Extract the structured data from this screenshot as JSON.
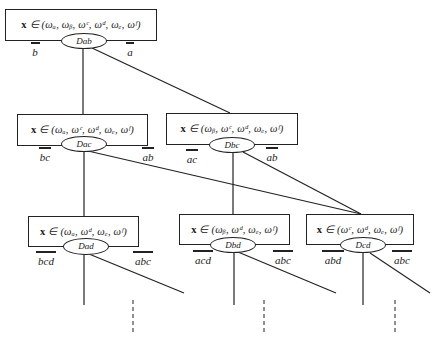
{
  "diagram": {
    "nodes": [
      {
        "id": "ab",
        "set": "x ∈ (ω a, ω b, ω c, ω d, ω e, ω f)",
        "set_prefix": "x",
        "set_rest": " ∈ (ωₐ, ωᵦ, ωᶜ, ωᵈ, ωₑ, ωᶠ)",
        "decision": "Dab",
        "left_label": "b",
        "right_label": "a"
      },
      {
        "id": "ac",
        "set": "x ∈ (ω a, ω c, ω d, ω e, ω f)",
        "set_prefix": "x",
        "set_rest": " ∈ (ωₐ, ωᶜ, ωᵈ, ωₑ, ωᶠ)",
        "decision": "Dac",
        "left_label": "bc",
        "right_label": "ab"
      },
      {
        "id": "bc",
        "set": "x ∈ (ω b, ω c, ω d, ω e, ω f)",
        "set_prefix": "x",
        "set_rest": " ∈ (ωᵦ, ωᶜ, ωᵈ, ωₑ, ωᶠ)",
        "decision": "Dbc",
        "left_label": "ac",
        "right_label": "ab"
      },
      {
        "id": "ad",
        "set": "x ∈ (ω a, ω d, ω e, ω f)",
        "set_prefix": "x",
        "set_rest": " ∈ (ωₐ, ωᵈ, ωₑ, ωᶠ)",
        "decision": "Dad",
        "left_label": "bcd",
        "right_label": "abc"
      },
      {
        "id": "bd",
        "set": "x ∈ (ω b, ω d, ω e, ω f)",
        "set_prefix": "x",
        "set_rest": " ∈ (ωᵦ, ωᵈ, ωₑ, ωᶠ)",
        "decision": "Dbd",
        "left_label": "acd",
        "right_label": "abc"
      },
      {
        "id": "cd",
        "set": "x ∈ (ω c, ω d, ω e, ω f)",
        "set_prefix": "x",
        "set_rest": " ∈ (ωᶜ, ωᵈ, ωₑ, ωᶠ)",
        "decision": "Dcd",
        "left_label": "abd",
        "right_label": "abc"
      }
    ],
    "edges": [
      {
        "from": "Dab",
        "to": "ac"
      },
      {
        "from": "Dab",
        "to": "bc"
      },
      {
        "from": "Dac",
        "to": "ad"
      },
      {
        "from": "Dac",
        "to": "cd"
      },
      {
        "from": "Dbc",
        "to": "bd"
      },
      {
        "from": "Dbc",
        "to": "cd"
      }
    ],
    "continuation": "dashed lines indicate further levels"
  }
}
